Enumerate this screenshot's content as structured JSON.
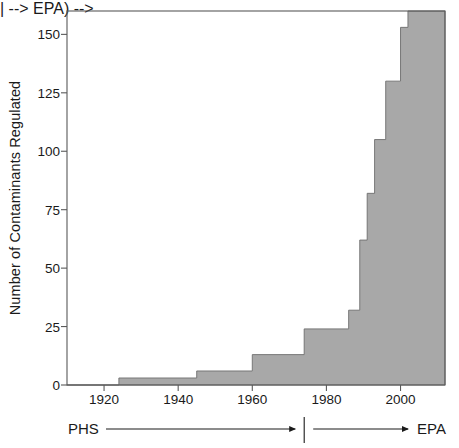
{
  "chart_data": {
    "type": "area",
    "title": "",
    "subtitle": "",
    "xlabel": "",
    "ylabel": "Number of Contaminants Regulated",
    "xlim": [
      1910,
      2012
    ],
    "ylim": [
      0,
      160
    ],
    "grid": false,
    "legend": null,
    "step_style": "post",
    "fill_color": "#a8a8a8",
    "line_color": "#6e6e6e",
    "x": [
      1910,
      1924,
      1945,
      1960,
      1974,
      1986,
      1989,
      1991,
      1993,
      1996,
      2000,
      2002,
      2012
    ],
    "values": [
      0,
      3,
      6,
      13,
      24,
      32,
      62,
      82,
      105,
      130,
      153,
      160,
      160
    ],
    "xticks": [
      1920,
      1940,
      1960,
      1980,
      2000
    ],
    "xtick_labels": [
      "1920",
      "1940",
      "1960",
      "1980",
      "2000"
    ],
    "yticks": [
      0,
      25,
      50,
      75,
      100,
      125,
      150
    ],
    "ytick_labels": [
      "0",
      "25",
      "50",
      "75",
      "100",
      "125",
      "150"
    ],
    "annotations": [
      {
        "name": "phs-era",
        "label": "PHS",
        "start_year": 1910,
        "end_year": 1974
      },
      {
        "name": "epa-era",
        "label": "EPA",
        "start_year": 1974,
        "end_year": 2012
      }
    ]
  },
  "axis": {
    "ylabel": "Number of Contaminants Regulated"
  },
  "era": {
    "phs_label": "PHS",
    "epa_label": "EPA"
  }
}
